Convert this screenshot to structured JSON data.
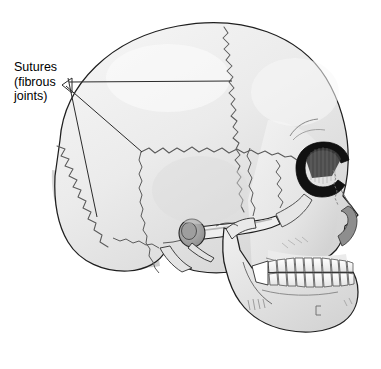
{
  "figure": {
    "type": "anatomical-illustration",
    "background_color": "#ffffff"
  },
  "label": {
    "name": "sutures-label",
    "line1": "Sutures",
    "line2": "(fibrous",
    "line3": "joints)",
    "full_text": "Sutures (fibrous joints)",
    "color": "#000000"
  },
  "leaders": {
    "origin": {
      "x": 63,
      "y": 85
    },
    "lines": [
      {
        "name": "leader-to-coronal-suture",
        "x1": 63,
        "y1": 85,
        "x2": 232,
        "y2": 82
      },
      {
        "name": "leader-to-squamous-suture",
        "x1": 63,
        "y1": 85,
        "x2": 141,
        "y2": 152
      },
      {
        "name": "leader-to-lambdoid-suture",
        "x1": 67,
        "y1": 79,
        "x2": 96,
        "y2": 216
      }
    ],
    "arrowhead": {
      "x": 63,
      "y": 85
    },
    "stroke_color": "#2b2b2b"
  },
  "palette": {
    "bone_fill": "#e9e9e9",
    "bone_fill_light": "#f2f2f2",
    "bone_shade": "#d6d6d6",
    "bone_shade_deep": "#c4c4c4",
    "outline": "#1f1f1f",
    "suture_line": "#5a5a5a",
    "orbit_dark": "#111111",
    "tooth_fill": "#fbfbfb",
    "background": "#ffffff"
  },
  "structures": [
    {
      "name": "cranial-vault",
      "label": "cranial vault"
    },
    {
      "name": "frontal-bone",
      "label": "frontal bone"
    },
    {
      "name": "parietal-bone",
      "label": "parietal bone"
    },
    {
      "name": "occipital-bone",
      "label": "occipital bone"
    },
    {
      "name": "temporal-bone",
      "label": "temporal bone"
    },
    {
      "name": "coronal-suture",
      "label": "coronal suture"
    },
    {
      "name": "squamous-suture",
      "label": "squamous suture"
    },
    {
      "name": "lambdoid-suture",
      "label": "lambdoid suture"
    },
    {
      "name": "orbit",
      "label": "orbit (eye socket)"
    },
    {
      "name": "nasal-aperture",
      "label": "nasal aperture"
    },
    {
      "name": "zygomatic-arch",
      "label": "zygomatic arch"
    },
    {
      "name": "external-auditory-meatus",
      "label": "external auditory meatus"
    },
    {
      "name": "styloid-process",
      "label": "styloid process"
    },
    {
      "name": "mandible",
      "label": "mandible"
    },
    {
      "name": "maxillary-teeth",
      "label": "upper teeth"
    },
    {
      "name": "mandibular-teeth",
      "label": "lower teeth"
    },
    {
      "name": "mental-foramen",
      "label": "mental foramen"
    }
  ],
  "teeth": {
    "upper_count": 10,
    "lower_count": 10
  }
}
